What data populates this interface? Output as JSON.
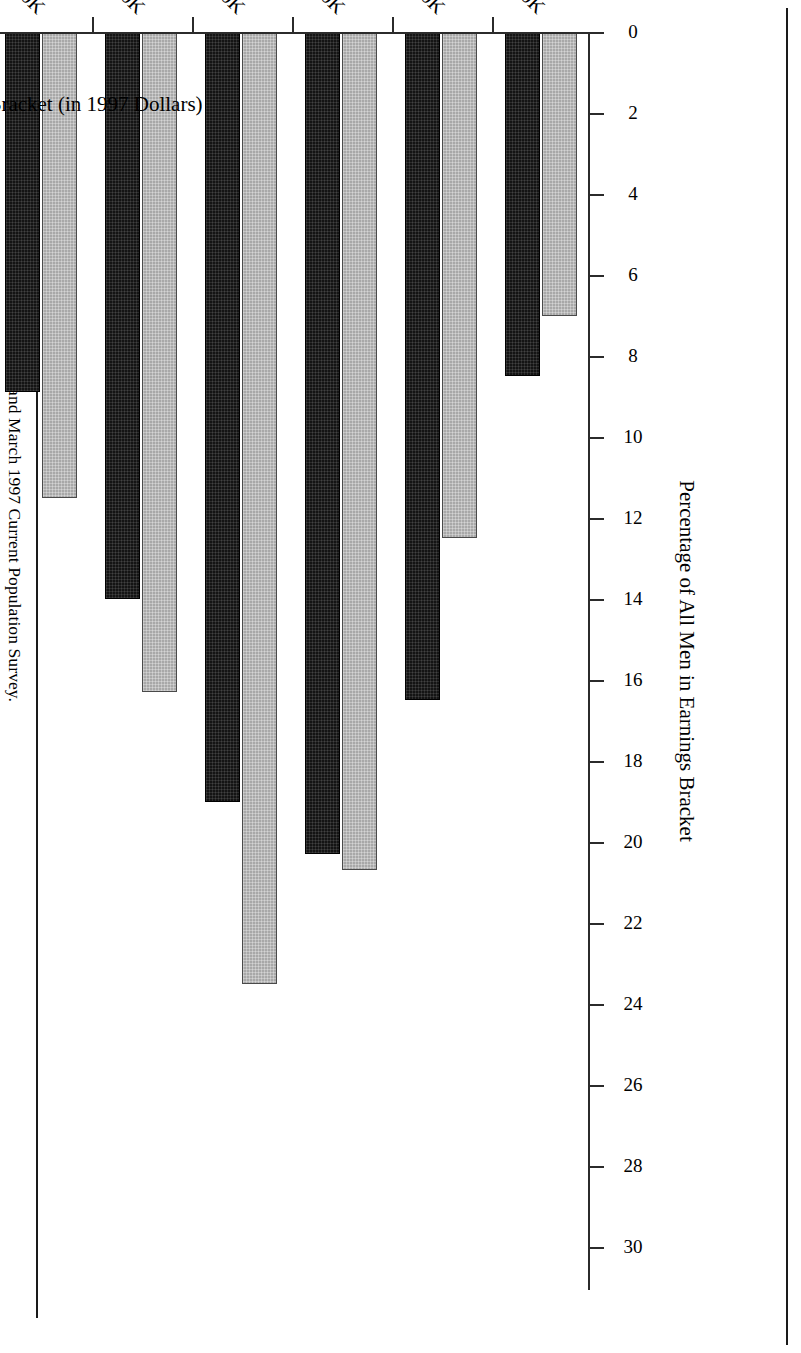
{
  "figure": {
    "source_note_label": "Sources:",
    "source_note_text": " Author's tabulations of the March 1980 and March 1997 Current Population Survey."
  },
  "legend": {
    "title": "Gini Inequality Index",
    "entries": [
      {
        "series": "1979",
        "swatch": "gray-hatched-swatch",
        "text": "1979 = 0.364"
      },
      {
        "series": "1996",
        "swatch": "black-swatch",
        "text": "1996 = 0.414"
      }
    ]
  },
  "chart_data": {
    "type": "bar",
    "title": "",
    "orientation": "horizontal",
    "xlabel": "Total Earnings Bracket (in 1997 Dollars)",
    "ylabel": "Percentage of All Men in Earnings Bracket",
    "ylim": [
      0,
      30
    ],
    "yticks": [
      0,
      2,
      4,
      6,
      8,
      10,
      12,
      14,
      16,
      18,
      20,
      22,
      24,
      26,
      28,
      30
    ],
    "ytick_labels": [
      "0",
      "2",
      "4",
      "6",
      "8",
      "10",
      "12",
      "14",
      "16",
      "18",
      "20",
      "22",
      "24",
      "26",
      "28",
      "30"
    ],
    "grid": false,
    "legend_position": "inside-right",
    "categories": [
      "$1-$10K",
      ">$10-$20K",
      ">$20-$30K",
      ">$30-$40K",
      ">$40-$50K",
      ">$50-$60K",
      ">$60-$70K",
      ">$70-$80K",
      ">$80-$90K",
      ">$90-$100K",
      ">$100K"
    ],
    "series": [
      {
        "name": "1979",
        "color": "#a8a8a8",
        "values": [
          7.0,
          12.5,
          20.7,
          23.5,
          16.3,
          11.5,
          5.6,
          3.1,
          2.1,
          1.1,
          2.9
        ]
      },
      {
        "name": "1996",
        "color": "#141414",
        "values": [
          8.5,
          16.5,
          20.3,
          19.0,
          14.0,
          8.9,
          6.3,
          4.0,
          2.6,
          1.7,
          5.1
        ]
      }
    ],
    "annotations": [
      "Gini Inequality Index",
      "1979 = 0.364",
      "1996 = 0.414"
    ]
  }
}
